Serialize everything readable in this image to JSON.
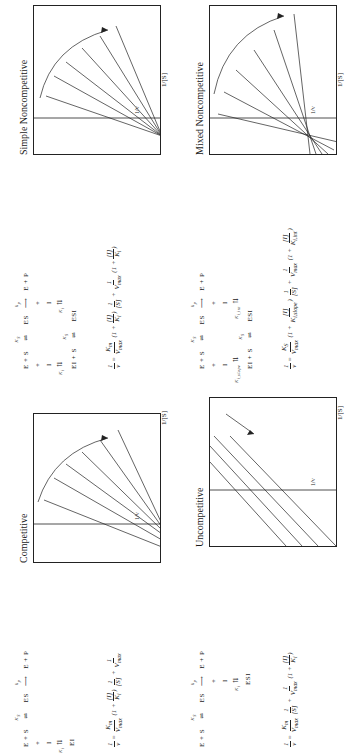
{
  "panels": [
    {
      "id": "competitive",
      "title": "Competitive",
      "scheme": {
        "row1": "E  +  S",
        "ks_label": "K_S",
        "es": "ES",
        "kp_label": "k_p",
        "row1_tail": "E  +  P",
        "plus": "+",
        "inhibitor": "I",
        "ki_label": "K_i",
        "complex": "EI"
      },
      "equation": {
        "lhs": "1/v",
        "text": "1/v = (K_m / V_max)(1 + [I]/K_i)(1/[S]) + 1/V_max"
      },
      "axes": {
        "x": "1/[S]",
        "y": "1/v"
      }
    },
    {
      "id": "simple-noncompetitive",
      "title": "Simple Noncompetitive",
      "scheme": {
        "row1": "E  +  S",
        "ks_label": "K_S",
        "es": "ES",
        "kp_label": "k_p",
        "row1_tail": "E  +  P",
        "plus": "+",
        "inhibitor": "I",
        "ki_label": "K_i",
        "complex_left": "EI  +  S",
        "ks2_label": "K_S",
        "complex_right": "ESI"
      },
      "equation": {
        "text": "1/v = (K_m / V_max)(1 + [I]/K_i)(1/[S]) + (1/V_max)(1 + [I]/K_i)"
      },
      "axes": {
        "x": "1/[S]",
        "y": "1/v"
      }
    },
    {
      "id": "uncompetitive",
      "title": "Uncompetitive",
      "scheme": {
        "row1": "E  +  S",
        "ks_label": "K_S",
        "es": "ES",
        "kp_label": "k_p",
        "row1_tail": "E  +  P",
        "plus": "+",
        "inhibitor": "I",
        "ki_label": "K_i",
        "complex": "ESI"
      },
      "equation": {
        "text": "1/v = (K_m / V_max)(1/[S]) + (1/V_max)(1 + [I]/K_i)"
      },
      "axes": {
        "x": "1/[S]",
        "y": "1/v"
      }
    },
    {
      "id": "mixed-noncompetitive",
      "title": "Mixed Noncompetitive",
      "scheme": {
        "row1": "E  +  S",
        "ks_label": "K_S",
        "es": "ES",
        "kp_label": "k_p",
        "row1_tail": "E  +  P",
        "plus": "+",
        "inhibitor": "I",
        "ki_left_label": "K_i,slope",
        "ki_right_label": "K_i,int",
        "complex_left": "EI  +  S",
        "ks2_label": "K_S",
        "complex_right": "ESI"
      },
      "equation": {
        "text": "1/v = (K_S / V_max)(1 + [I]/K_i,slope)(1/[S]) + (1/V_max)(1 + [I]/K_i,int)"
      },
      "axes": {
        "x": "1/[S]",
        "y": "1/v"
      }
    }
  ],
  "colors": {
    "ink": "#1a1a1a",
    "background": "#ffffff"
  }
}
